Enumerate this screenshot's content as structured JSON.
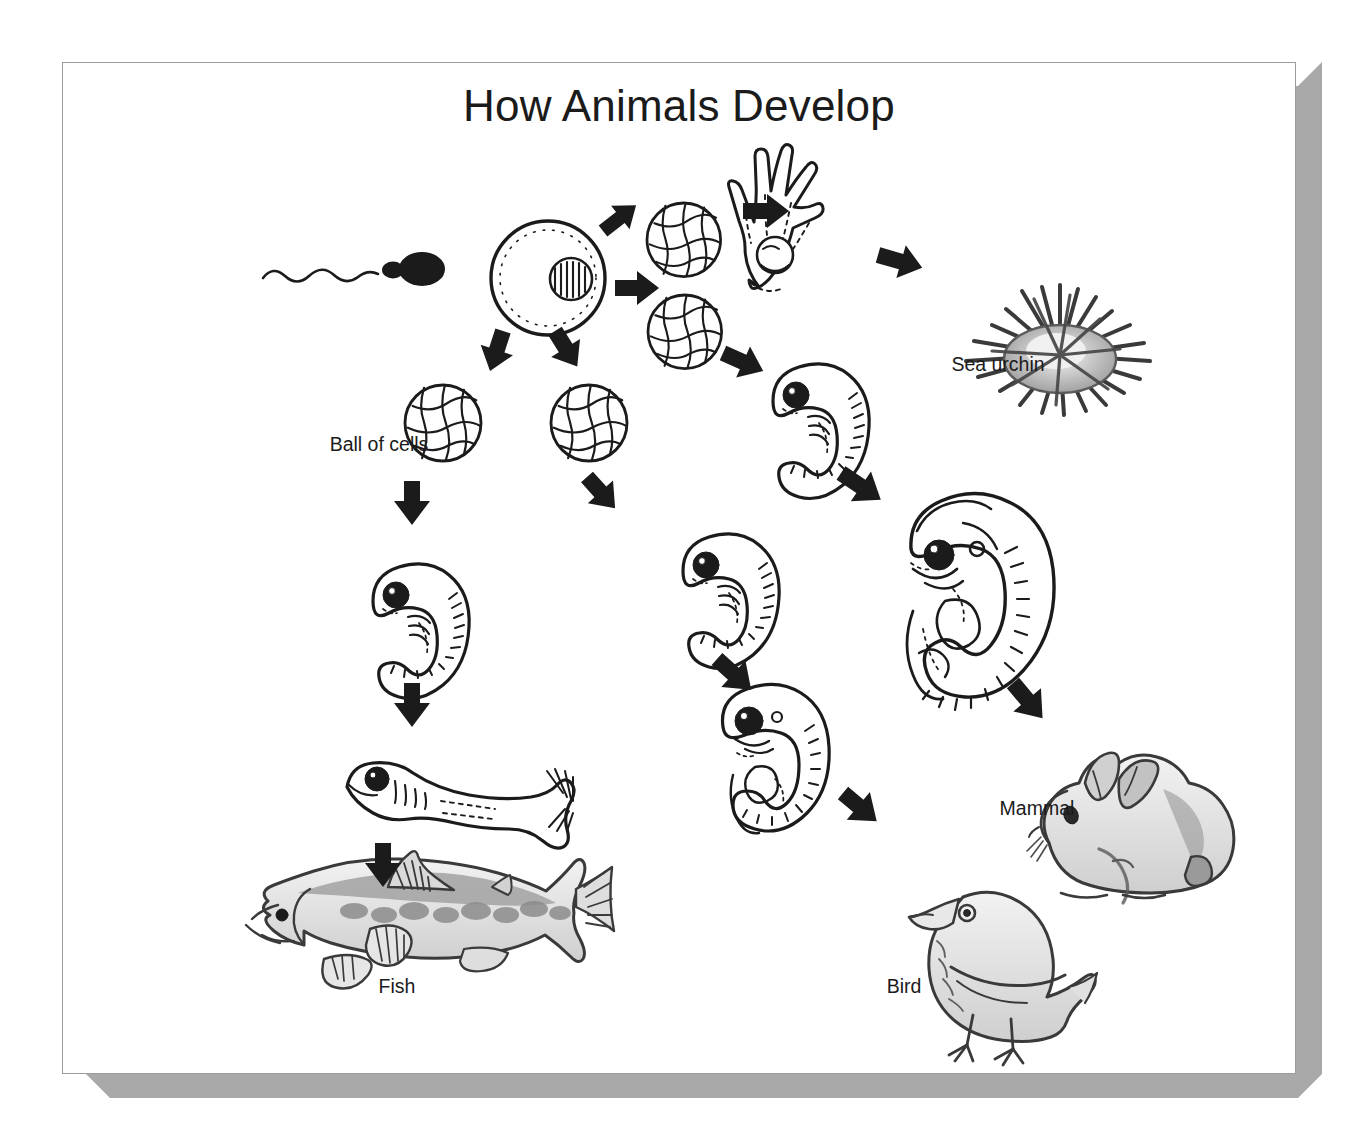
{
  "figure": {
    "title": "How Animals Develop",
    "type": "biology-diagram",
    "background_color": "#ffffff",
    "ink_color": "#1b1b1b",
    "panel_border_color": "#9c9c9c",
    "shadow_color": "#a9a9a9"
  },
  "labels": [
    {
      "id": "ball-of-cells",
      "text": "Ball of cells",
      "x": 316,
      "y": 448
    },
    {
      "id": "sea-urchin",
      "text": "Sea urchin",
      "x": 997,
      "y": 368
    },
    {
      "id": "mammal",
      "text": "Mammal",
      "x": 1036,
      "y": 812
    },
    {
      "id": "fish",
      "text": "Fish",
      "x": 396,
      "y": 990
    },
    {
      "id": "bird",
      "text": "Bird",
      "x": 903,
      "y": 990
    }
  ],
  "stages": [
    {
      "id": "sperm",
      "name": "sperm cell",
      "lineage": "shared"
    },
    {
      "id": "egg",
      "name": "fertilized egg",
      "lineage": "shared"
    },
    {
      "id": "blastula-urchin",
      "name": "ball of cells (blastula)",
      "lineage": "sea urchin"
    },
    {
      "id": "pluteus-larva",
      "name": "sea urchin larva",
      "lineage": "sea urchin"
    },
    {
      "id": "adult-sea-urchin",
      "name": "adult sea urchin",
      "lineage": "sea urchin"
    },
    {
      "id": "blastula-mammal",
      "name": "ball of cells (blastula)",
      "lineage": "mammal"
    },
    {
      "id": "embryo-mammal-1",
      "name": "early mammal embryo",
      "lineage": "mammal"
    },
    {
      "id": "embryo-mammal-2",
      "name": "late mammal embryo",
      "lineage": "mammal"
    },
    {
      "id": "adult-mammal",
      "name": "rabbit",
      "lineage": "mammal"
    },
    {
      "id": "blastula-bird",
      "name": "ball of cells (blastula)",
      "lineage": "bird"
    },
    {
      "id": "embryo-bird-1",
      "name": "early bird embryo",
      "lineage": "bird"
    },
    {
      "id": "embryo-bird-2",
      "name": "late bird embryo",
      "lineage": "bird"
    },
    {
      "id": "adult-bird",
      "name": "chick",
      "lineage": "bird"
    },
    {
      "id": "blastula-fish",
      "name": "ball of cells (blastula)",
      "lineage": "fish"
    },
    {
      "id": "embryo-fish",
      "name": "fish embryo",
      "lineage": "fish"
    },
    {
      "id": "larva-fish",
      "name": "fish larva",
      "lineage": "fish"
    },
    {
      "id": "adult-fish",
      "name": "adult fish",
      "lineage": "fish"
    }
  ],
  "arrows": [
    {
      "from": "egg",
      "to": "blastula-urchin"
    },
    {
      "from": "blastula-urchin",
      "to": "pluteus-larva"
    },
    {
      "from": "pluteus-larva",
      "to": "adult-sea-urchin"
    },
    {
      "from": "egg",
      "to": "blastula-mammal"
    },
    {
      "from": "blastula-mammal",
      "to": "embryo-mammal-1"
    },
    {
      "from": "embryo-mammal-1",
      "to": "embryo-mammal-2"
    },
    {
      "from": "embryo-mammal-2",
      "to": "adult-mammal"
    },
    {
      "from": "egg",
      "to": "blastula-bird"
    },
    {
      "from": "blastula-bird",
      "to": "embryo-bird-1"
    },
    {
      "from": "embryo-bird-1",
      "to": "embryo-bird-2"
    },
    {
      "from": "embryo-bird-2",
      "to": "adult-bird"
    },
    {
      "from": "egg",
      "to": "blastula-fish"
    },
    {
      "from": "blastula-fish",
      "to": "embryo-fish"
    },
    {
      "from": "embryo-fish",
      "to": "larva-fish"
    },
    {
      "from": "larva-fish",
      "to": "adult-fish"
    }
  ]
}
